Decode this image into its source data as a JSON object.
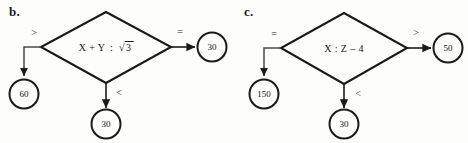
{
  "diagram": {
    "type": "flowchart-comparison-pair",
    "panels": [
      {
        "id": "b",
        "letter": "b.",
        "decision": {
          "text": "X + Y : √3",
          "left_operand": "X + Y",
          "operator": ":",
          "right_operand": "√3",
          "radicand": "3"
        },
        "branches": [
          {
            "direction": "left",
            "label": ">",
            "result": "60"
          },
          {
            "direction": "bottom",
            "label": "<",
            "result": "30"
          },
          {
            "direction": "right",
            "label": "=",
            "result": "30"
          }
        ]
      },
      {
        "id": "c",
        "letter": "c.",
        "decision": {
          "text": "X : Z – 4",
          "left_operand": "X",
          "operator": ":",
          "right_operand": "Z – 4"
        },
        "branches": [
          {
            "direction": "left",
            "label": "=",
            "result": "150"
          },
          {
            "direction": "bottom",
            "label": "<",
            "result": "30"
          },
          {
            "direction": "right",
            "label": ">",
            "result": "50"
          }
        ]
      }
    ]
  },
  "colors": {
    "ink": "#111111",
    "page": "#fdfdfb",
    "stroke": "#1a1a1a"
  }
}
